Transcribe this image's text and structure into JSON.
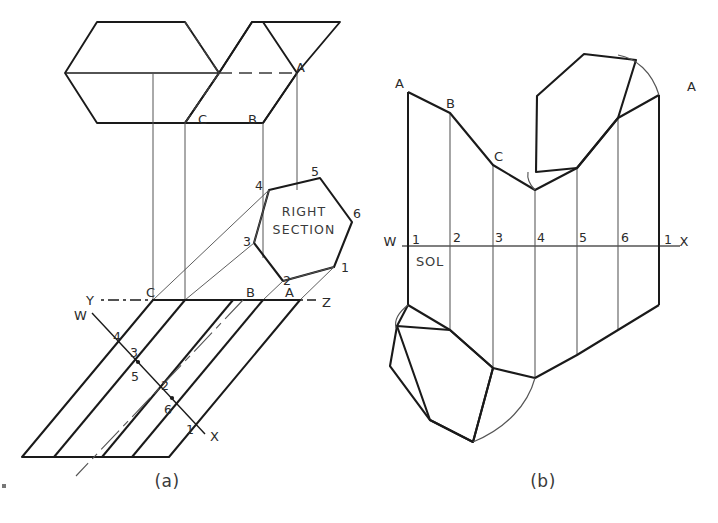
{
  "figure": {
    "background_color": "#ffffff",
    "ink_color": "#1a1a1a",
    "thin_ink_color": "#555555",
    "width": 718,
    "height": 523
  },
  "panel_a": {
    "caption": "(a)",
    "section_label_line1": "RIGHT",
    "section_label_line2": "SECTION",
    "ground_line": {
      "left_label": "Y",
      "right_label": "Z"
    },
    "cutting_plane": {
      "start_label": "W",
      "end_label": "X"
    },
    "top_view_labels": [
      {
        "text": "A",
        "x": 296,
        "y": 72
      },
      {
        "text": "C",
        "x": 202,
        "y": 122
      },
      {
        "text": "B",
        "x": 252,
        "y": 122
      }
    ],
    "ground_line_labels": [
      {
        "text": "Y",
        "x": 92,
        "y": 303
      },
      {
        "text": "C",
        "x": 150,
        "y": 295
      },
      {
        "text": "B",
        "x": 250,
        "y": 295
      },
      {
        "text": "A",
        "x": 288,
        "y": 295
      },
      {
        "text": "Z",
        "x": 322,
        "y": 305
      }
    ],
    "section_vertex_labels": [
      {
        "text": "1",
        "x": 340,
        "y": 268
      },
      {
        "text": "2",
        "x": 288,
        "y": 281
      },
      {
        "text": "3",
        "x": 246,
        "y": 240
      },
      {
        "text": "4",
        "x": 259,
        "y": 186
      },
      {
        "text": "5",
        "x": 313,
        "y": 172
      },
      {
        "text": "6",
        "x": 352,
        "y": 213
      }
    ],
    "oblique_element_labels": [
      {
        "text": "W",
        "x": 79,
        "y": 316
      },
      {
        "text": "4",
        "x": 116,
        "y": 337
      },
      {
        "text": "3",
        "x": 133,
        "y": 353
      },
      {
        "text": "5",
        "x": 134,
        "y": 377
      },
      {
        "text": "2",
        "x": 164,
        "y": 386
      },
      {
        "text": "6",
        "x": 167,
        "y": 410
      },
      {
        "text": "1",
        "x": 188,
        "y": 430
      },
      {
        "text": "X",
        "x": 213,
        "y": 437
      }
    ]
  },
  "panel_b": {
    "caption": "(b)",
    "sol_label": "SOL",
    "stretchout_line": {
      "left_label": "W",
      "right_label": "X"
    },
    "element_numbers": [
      "1",
      "2",
      "3",
      "4",
      "5",
      "6",
      "1"
    ],
    "element_number_positions": [
      {
        "text": "1",
        "x": 412,
        "y": 242
      },
      {
        "text": "2",
        "x": 455,
        "y": 240
      },
      {
        "text": "3",
        "x": 495,
        "y": 240
      },
      {
        "text": "4",
        "x": 537,
        "y": 240
      },
      {
        "text": "5",
        "x": 578,
        "y": 240
      },
      {
        "text": "6",
        "x": 621,
        "y": 240
      },
      {
        "text": "1",
        "x": 660,
        "y": 242
      }
    ],
    "top_edge_labels": [
      {
        "text": "A",
        "x": 398,
        "y": 90
      },
      {
        "text": "B",
        "x": 450,
        "y": 110
      },
      {
        "text": "C",
        "x": 500,
        "y": 163
      },
      {
        "text": "A",
        "x": 689,
        "y": 92
      }
    ],
    "axis_end_labels": [
      {
        "text": "W",
        "x": 392,
        "y": 242
      },
      {
        "text": "X",
        "x": 687,
        "y": 242
      }
    ]
  }
}
